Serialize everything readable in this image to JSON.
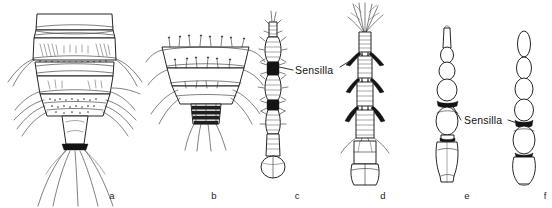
{
  "figure": {
    "width": 552,
    "height": 208,
    "background_color": "#ffffff",
    "ink_color": "#1a1a1a",
    "type": "scientific-line-drawing"
  },
  "callouts": [
    {
      "id": "sensilla-cd",
      "label": "Sensilla",
      "text_x": 295,
      "text_y": 71,
      "targets": [
        "c",
        "d"
      ]
    },
    {
      "id": "sensilla-ef",
      "label": "Sensilla",
      "text_x": 464,
      "text_y": 123,
      "targets": [
        "e",
        "f"
      ]
    }
  ],
  "panels": [
    {
      "key": "a",
      "letter": "a",
      "letter_x": 112,
      "letter_y": 199,
      "description": "Ventral view of segmented abdomen tapering to anal segment with long caudal setae",
      "center_x": 75,
      "segments": 5
    },
    {
      "key": "b",
      "letter": "b",
      "letter_x": 214,
      "letter_y": 199,
      "description": "Terminal abdominal segments, funnel shaped, with rows of short setae",
      "center_x": 205,
      "segments": 3
    },
    {
      "key": "c",
      "letter": "c",
      "letter_x": 297,
      "letter_y": 199,
      "description": "Slender annulated antenna with dark sensilla patches and basal bulb",
      "center_x": 272,
      "segments": 6
    },
    {
      "key": "d",
      "letter": "d",
      "letter_x": 383,
      "letter_y": 199,
      "description": "Antenna with plumose apical tuft, paired sensilla spines per segment",
      "center_x": 364,
      "segments": 6
    },
    {
      "key": "e",
      "letter": "e",
      "letter_x": 467,
      "letter_y": 199,
      "description": "Moniliform antenna, smooth oval segments widening basally, one dark sensilla band",
      "center_x": 447,
      "segments": 7
    },
    {
      "key": "f",
      "letter": "f",
      "letter_x": 545,
      "letter_y": 199,
      "description": "Beaded antenna of oval segments with dark sensilla band near base",
      "center_x": 524,
      "segments": 6
    }
  ]
}
